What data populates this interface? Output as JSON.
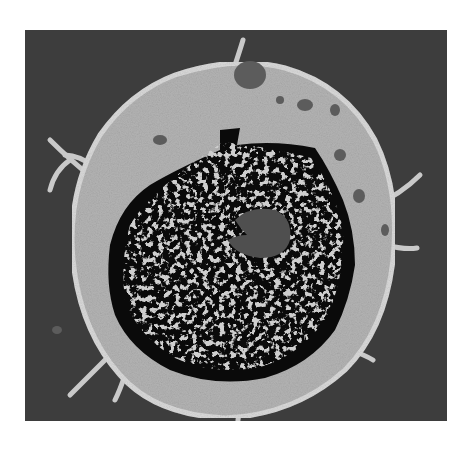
{
  "image": {
    "subject": "cell",
    "description": "Grayscale transmission electron micrograph of a cell with a large dark, irregular nucleus containing a gray nucleolus, surrounded by a light granular cytoplasm with small dark vesicles and thin membrane projections, on a dark gray background.",
    "colors": {
      "page_background": "#ffffff",
      "frame_background": "#3d3d3d",
      "cytoplasm": "#b4b4b4",
      "cytoplasm_edge": "#d6d6d6",
      "nucleus": "#0a0a0a",
      "chromatin": "#9a9a9a",
      "nucleolus": "#4f4f4f",
      "vesicles": "#5a5a5a"
    }
  }
}
